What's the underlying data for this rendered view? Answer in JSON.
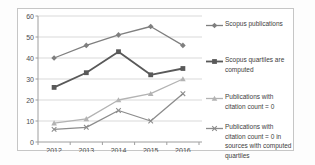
{
  "chart_data": {
    "type": "line",
    "title": "",
    "xlabel": "",
    "ylabel": "",
    "categories": [
      "2012",
      "2013",
      "2014",
      "2015",
      "2016"
    ],
    "ylim": [
      0,
      60
    ],
    "yticks": [
      0,
      10,
      20,
      30,
      40,
      50,
      60
    ],
    "grid": true,
    "legend_position": "right",
    "series": [
      {
        "name": "Scopus publications",
        "values": [
          40,
          46,
          51,
          55,
          46
        ],
        "color": "#7f7f7f",
        "marker": "diamond",
        "line_width": 1.3
      },
      {
        "name": "Scopus quartiles are computed",
        "values": [
          26,
          33,
          43,
          32,
          35
        ],
        "color": "#595959",
        "marker": "square",
        "line_width": 1.8
      },
      {
        "name": "Publications with citation count = 0",
        "values": [
          9,
          11,
          20,
          23,
          30
        ],
        "color": "#b3b3b3",
        "marker": "triangle",
        "line_width": 1.3
      },
      {
        "name": "Publications with citation count = 0 in sources with computed quartiles",
        "values": [
          6,
          7,
          15,
          10,
          23
        ],
        "color": "#8c8c8c",
        "marker": "x",
        "line_width": 1.3
      }
    ],
    "colors": {
      "gridline": "#d9d9d9",
      "axis": "#9e9e9e",
      "frame_border": "#c6c6c6",
      "background": "#ffffff",
      "tick_text": "#4d4d4d"
    }
  }
}
